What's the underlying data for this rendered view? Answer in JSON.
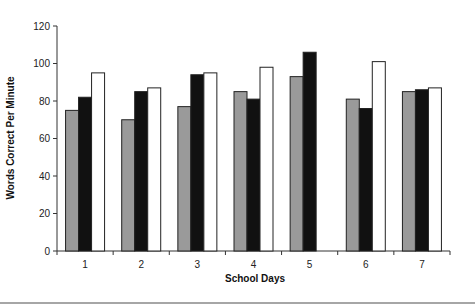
{
  "chart_data": {
    "type": "bar",
    "title": "",
    "xlabel": "School Days",
    "ylabel": "Words Correct Per Minute",
    "categories": [
      "1",
      "2",
      "3",
      "4",
      "5",
      "6",
      "7"
    ],
    "series": [
      {
        "name": "Series 1 (gray)",
        "color": "#9a9a9a",
        "values": [
          75,
          70,
          77,
          85,
          93,
          81,
          85
        ]
      },
      {
        "name": "Series 2 (black)",
        "color": "#111111",
        "values": [
          82,
          85,
          94,
          81,
          106,
          76,
          86
        ]
      },
      {
        "name": "Series 3 (white)",
        "color": "#ffffff",
        "values": [
          95,
          87,
          95,
          98,
          null,
          101,
          87
        ]
      }
    ],
    "ylim": [
      0,
      120
    ],
    "yticks": [
      0,
      20,
      40,
      60,
      80,
      100,
      120
    ],
    "grid": false,
    "legend": "none"
  }
}
